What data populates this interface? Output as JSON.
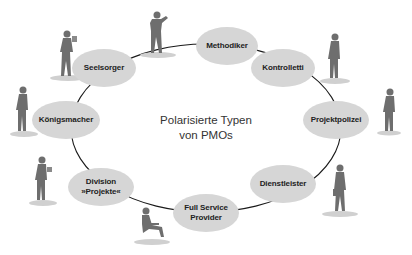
{
  "diagram": {
    "title_line1": "Polarisierte Typen",
    "title_line2": "von PMOs",
    "colors": {
      "node_fill": "#d6d6d6",
      "line": "#1a1a1a",
      "figure": "#6a6a6a",
      "text": "#222222"
    },
    "nodes": [
      {
        "id": "methodiker",
        "line1": "Methodiker",
        "line2": ""
      },
      {
        "id": "kontrolletti",
        "line1": "Kontrolletti",
        "line2": ""
      },
      {
        "id": "projektpolizei",
        "line1": "Projektpolizei",
        "line2": ""
      },
      {
        "id": "dienstleister",
        "line1": "Dienstleister",
        "line2": ""
      },
      {
        "id": "full-service-provider",
        "line1": "Full Service",
        "line2": "Provider"
      },
      {
        "id": "division-projekte",
        "line1": "Division",
        "line2": "»Projekte«"
      },
      {
        "id": "koenigsmacher",
        "line1": "Königsmacher",
        "line2": ""
      },
      {
        "id": "seelsorger",
        "line1": "Seelsorger",
        "line2": ""
      }
    ],
    "edges": [
      [
        "seelsorger",
        "methodiker"
      ],
      [
        "methodiker",
        "kontrolletti"
      ],
      [
        "kontrolletti",
        "projektpolizei"
      ],
      [
        "projektpolizei",
        "dienstleister"
      ],
      [
        "dienstleister",
        "full-service-provider"
      ],
      [
        "full-service-provider",
        "division-projekte"
      ],
      [
        "division-projekte",
        "koenigsmacher"
      ],
      [
        "koenigsmacher",
        "seelsorger"
      ]
    ]
  }
}
